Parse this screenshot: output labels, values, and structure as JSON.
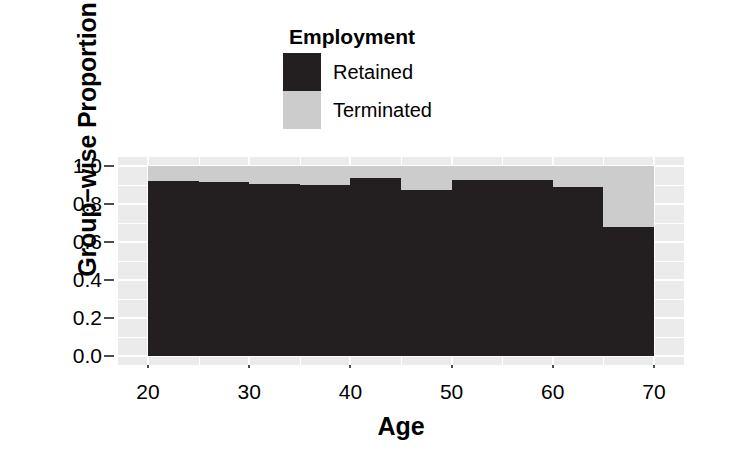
{
  "legend": {
    "title": "Employment",
    "items": [
      {
        "label": "Retained",
        "color": "#231f20"
      },
      {
        "label": "Terminated",
        "color": "#cccccc"
      }
    ]
  },
  "axes": {
    "x_title": "Age",
    "y_title": "Group−wise Proportion",
    "x_ticks": [
      "20",
      "30",
      "40",
      "50",
      "60",
      "70"
    ],
    "y_ticks": [
      "0.0",
      "0.2",
      "0.4",
      "0.6",
      "0.8",
      "1.0"
    ]
  },
  "chart_data": {
    "type": "bar",
    "stacked": true,
    "orientation": "vertical",
    "title": "",
    "subtitle": "",
    "xlabel": "Age",
    "ylabel": "Group−wise Proportion",
    "xlim": [
      20,
      70
    ],
    "ylim": [
      0.0,
      1.0
    ],
    "xticks": [
      20,
      30,
      40,
      50,
      60,
      70
    ],
    "yticks": [
      0.0,
      0.2,
      0.4,
      0.6,
      0.8,
      1.0
    ],
    "grid": true,
    "legend_title": "Employment",
    "legend_position": "top",
    "bin_width": 5,
    "categories": [
      "20–25",
      "25–30",
      "30–35",
      "35–40",
      "40–45",
      "45–50",
      "50–55",
      "55–60",
      "60–65",
      "65–70"
    ],
    "bin_starts": [
      20,
      25,
      30,
      35,
      40,
      45,
      50,
      55,
      60,
      65
    ],
    "bin_ends": [
      25,
      30,
      35,
      40,
      45,
      50,
      55,
      60,
      65,
      70
    ],
    "series": [
      {
        "name": "Retained",
        "color": "#231f20",
        "values": [
          0.92,
          0.915,
          0.905,
          0.9,
          0.935,
          0.875,
          0.925,
          0.925,
          0.89,
          0.68
        ]
      },
      {
        "name": "Terminated",
        "color": "#cccccc",
        "values": [
          0.08,
          0.085,
          0.095,
          0.1,
          0.065,
          0.125,
          0.075,
          0.075,
          0.11,
          0.32
        ]
      }
    ],
    "panel_background": "#ebebeb",
    "gridline_color": "#ffffff"
  }
}
